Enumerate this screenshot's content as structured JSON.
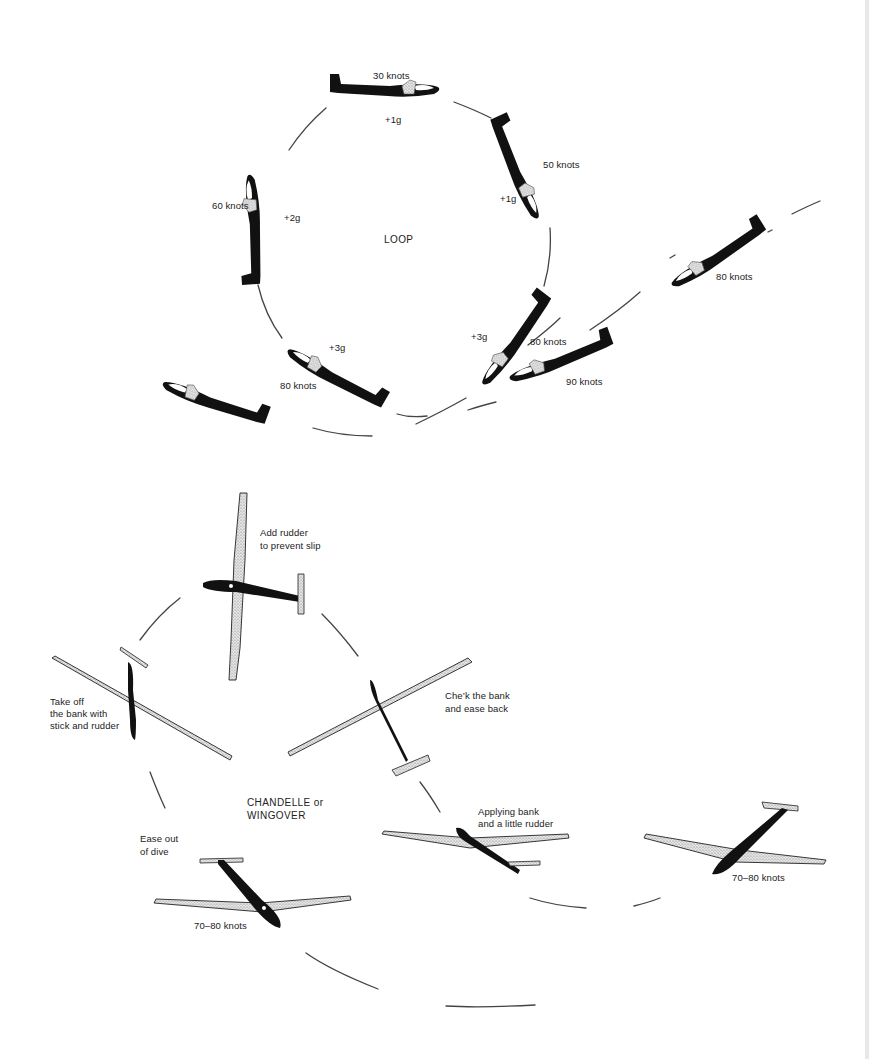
{
  "figure": {
    "diagrams": [
      {
        "name": "loop",
        "title": "LOOP",
        "positions": [
          {
            "id": "entry-80",
            "speed": "80 knots",
            "g": ""
          },
          {
            "id": "pull-up",
            "speed": "80 knots",
            "g": "+3g"
          },
          {
            "id": "vertical-up",
            "speed": "60 knots",
            "g": "+2g"
          },
          {
            "id": "top",
            "speed": "30 knots",
            "g": "+1g"
          },
          {
            "id": "descending",
            "speed": "50 knots",
            "g": "+1g"
          },
          {
            "id": "pull-out",
            "speed": "80 knots",
            "g": "+3g"
          },
          {
            "id": "recovery",
            "speed": "90 knots",
            "g": ""
          },
          {
            "id": "exit",
            "speed": "80 knots",
            "g": ""
          }
        ]
      },
      {
        "name": "chandelle",
        "title_line1": "CHANDELLE or",
        "title_line2": "WINGOVER",
        "positions": [
          {
            "id": "entry",
            "note": "",
            "speed": "70–80 knots"
          },
          {
            "id": "applying-bank",
            "note_line1": "Applying bank",
            "note_line2": "and a little rudder"
          },
          {
            "id": "check-bank",
            "note_line1": "Che’k the bank",
            "note_line2": "and ease back"
          },
          {
            "id": "top",
            "note_line1": "Add rudder",
            "note_line2": "to prevent slip"
          },
          {
            "id": "take-off-bank",
            "note_line1": "Take off",
            "note_line2": "the bank with",
            "note_line3": "stick and rudder"
          },
          {
            "id": "ease-out",
            "note_line1": "Ease out",
            "note_line2": "of dive"
          },
          {
            "id": "exit",
            "speed": "70–80 knots"
          }
        ]
      }
    ]
  },
  "colors": {
    "ink": "#111111",
    "wing_fill": "#d9d9d9",
    "canopy": "#ffffff",
    "line": "#444444"
  }
}
